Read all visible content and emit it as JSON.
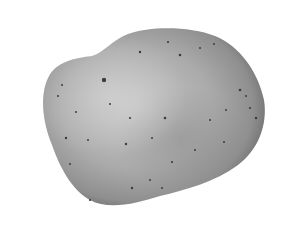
{
  "image": {
    "subject": "potato",
    "style": "grayscale photograph",
    "background_color": "#ffffff",
    "colors": {
      "skin_light": "#c4c4c4",
      "skin_mid": "#a3a3a3",
      "skin_dark": "#6e6e6e",
      "spot": "#3a3a3a"
    }
  }
}
